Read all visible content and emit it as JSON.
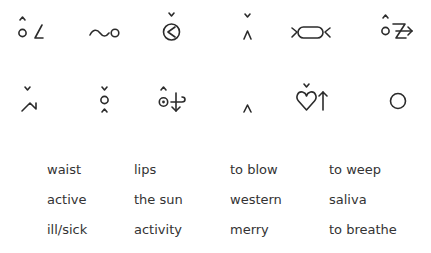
{
  "symbols": [
    {
      "row": 0,
      "col": 0,
      "name": "waist-symbol"
    },
    {
      "row": 0,
      "col": 1,
      "name": "lips-symbol"
    },
    {
      "row": 0,
      "col": 2,
      "name": "to-blow-symbol"
    },
    {
      "row": 0,
      "col": 3,
      "name": "to-weep-symbol"
    },
    {
      "row": 0,
      "col": 4,
      "name": "active-symbol"
    },
    {
      "row": 0,
      "col": 5,
      "name": "the-sun-symbol"
    },
    {
      "row": 1,
      "col": 0,
      "name": "western-symbol"
    },
    {
      "row": 1,
      "col": 1,
      "name": "saliva-symbol"
    },
    {
      "row": 1,
      "col": 2,
      "name": "ill-sick-symbol"
    },
    {
      "row": 1,
      "col": 3,
      "name": "activity-symbol"
    },
    {
      "row": 1,
      "col": 4,
      "name": "merry-symbol"
    },
    {
      "row": 1,
      "col": 5,
      "name": "to-breathe-symbol"
    }
  ],
  "words": {
    "rows": [
      [
        "waist",
        "lips",
        "to blow",
        "to weep"
      ],
      [
        "active",
        "the sun",
        "western",
        "saliva"
      ],
      [
        "ill/sick",
        "activity",
        "merry",
        "to breathe"
      ]
    ]
  }
}
